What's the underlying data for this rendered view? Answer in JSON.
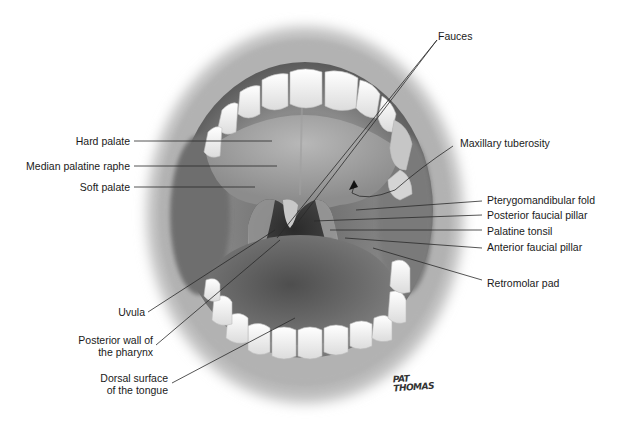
{
  "figure": {
    "labels_left": [
      {
        "id": "hard-palate",
        "text": "Hard palate"
      },
      {
        "id": "median-palatine-raphe",
        "text": "Median palatine raphe"
      },
      {
        "id": "soft-palate",
        "text": "Soft palate"
      },
      {
        "id": "uvula",
        "text": "Uvula"
      },
      {
        "id": "posterior-wall-pharynx",
        "line1": "Posterior wall of",
        "line2": "the pharynx"
      },
      {
        "id": "dorsal-surface-tongue",
        "line1": "Dorsal surface",
        "line2": "of the tongue"
      }
    ],
    "labels_right": [
      {
        "id": "fauces",
        "text": "Fauces"
      },
      {
        "id": "maxillary-tuberosity",
        "text": "Maxillary tuberosity"
      },
      {
        "id": "pterygomandibular-fold",
        "text": "Pterygomandibular fold"
      },
      {
        "id": "posterior-faucial-pillar",
        "text": "Posterior faucial pillar"
      },
      {
        "id": "palatine-tonsil",
        "text": "Palatine tonsil"
      },
      {
        "id": "anterior-faucial-pillar",
        "text": "Anterior faucial pillar"
      },
      {
        "id": "retromolar-pad",
        "text": "Retromolar pad"
      }
    ],
    "signature": {
      "line1": "PAT",
      "line2": "THOMAS"
    }
  }
}
